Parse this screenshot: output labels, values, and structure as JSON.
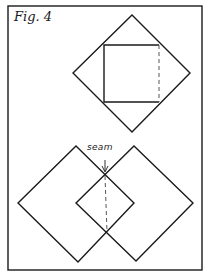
{
  "figure": {
    "caption": "Fig. 4",
    "seam_label": "seam",
    "colors": {
      "line": "#1a1a1a",
      "background": "#ffffff"
    },
    "border": {
      "x": 8,
      "y": 6,
      "w": 194,
      "h": 264
    },
    "top_diagram": {
      "diamond": [
        [
          132,
          15
        ],
        [
          190,
          73
        ],
        [
          132,
          132
        ],
        [
          73,
          73
        ]
      ],
      "inner_square": {
        "x1": 104,
        "y1": 45,
        "x2": 159,
        "y2": 102,
        "dashed_side": "right"
      }
    },
    "bottom_diagram": {
      "left_diamond": [
        [
          76,
          146
        ],
        [
          134,
          203
        ],
        [
          78,
          262
        ],
        [
          18,
          203
        ]
      ],
      "right_diamond": [
        [
          134,
          146
        ],
        [
          193,
          203
        ],
        [
          136,
          261
        ],
        [
          76,
          203
        ]
      ],
      "seam_line": [
        [
          105,
          176
        ],
        [
          107,
          232
        ]
      ],
      "seam_arrow": {
        "x": 105,
        "y1": 160,
        "y2": 172
      }
    }
  }
}
